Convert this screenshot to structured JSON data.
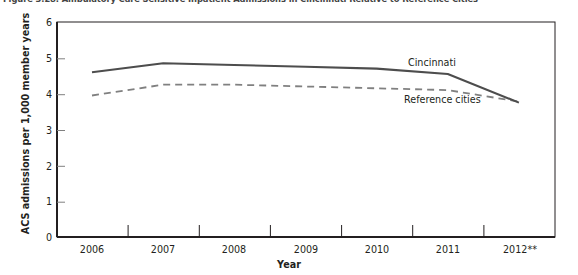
{
  "figure": {
    "title": "Figure 3.28. Ambulatory Care Sensitive Inpatient Admissions in Cincinnati Relative to Reference Cities"
  },
  "chart_data": {
    "type": "line",
    "title": "Figure 3.28. Ambulatory Care Sensitive Inpatient Admissions in Cincinnati Relative to Reference Cities",
    "xlabel": "Year",
    "ylabel": "ACS admissions per 1,000 member years",
    "categories": [
      "2006",
      "2007",
      "2008",
      "2009",
      "2010",
      "2011",
      "2012**"
    ],
    "x_tick_labels": [
      "2006",
      "2007",
      "2008",
      "2009",
      "2010",
      "2011",
      "2012**"
    ],
    "y_tick_labels": [
      "0",
      "1",
      "2",
      "3",
      "4",
      "5",
      "6"
    ],
    "ylim": [
      0,
      6
    ],
    "y_tick_step": 1,
    "grid": false,
    "legend": "inline-labels",
    "series": [
      {
        "name": "Cincinnati",
        "style": "solid",
        "color": "#4d4d4d",
        "values": [
          4.6,
          4.85,
          4.8,
          4.75,
          4.7,
          4.55,
          3.75
        ]
      },
      {
        "name": "Reference cities",
        "style": "dashed",
        "color": "#808080",
        "values": [
          3.95,
          4.25,
          4.25,
          4.2,
          4.15,
          4.1,
          3.78
        ]
      }
    ],
    "annotations": [
      {
        "text": "Cincinnati",
        "series": "Cincinnati"
      },
      {
        "text": "Reference cities",
        "series": "Reference cities"
      }
    ],
    "footnote_marker": "**"
  },
  "colors": {
    "cincinnati_line": "#4d4d4d",
    "reference_line": "#808080",
    "axis": "#231f20",
    "background": "#ffffff"
  }
}
